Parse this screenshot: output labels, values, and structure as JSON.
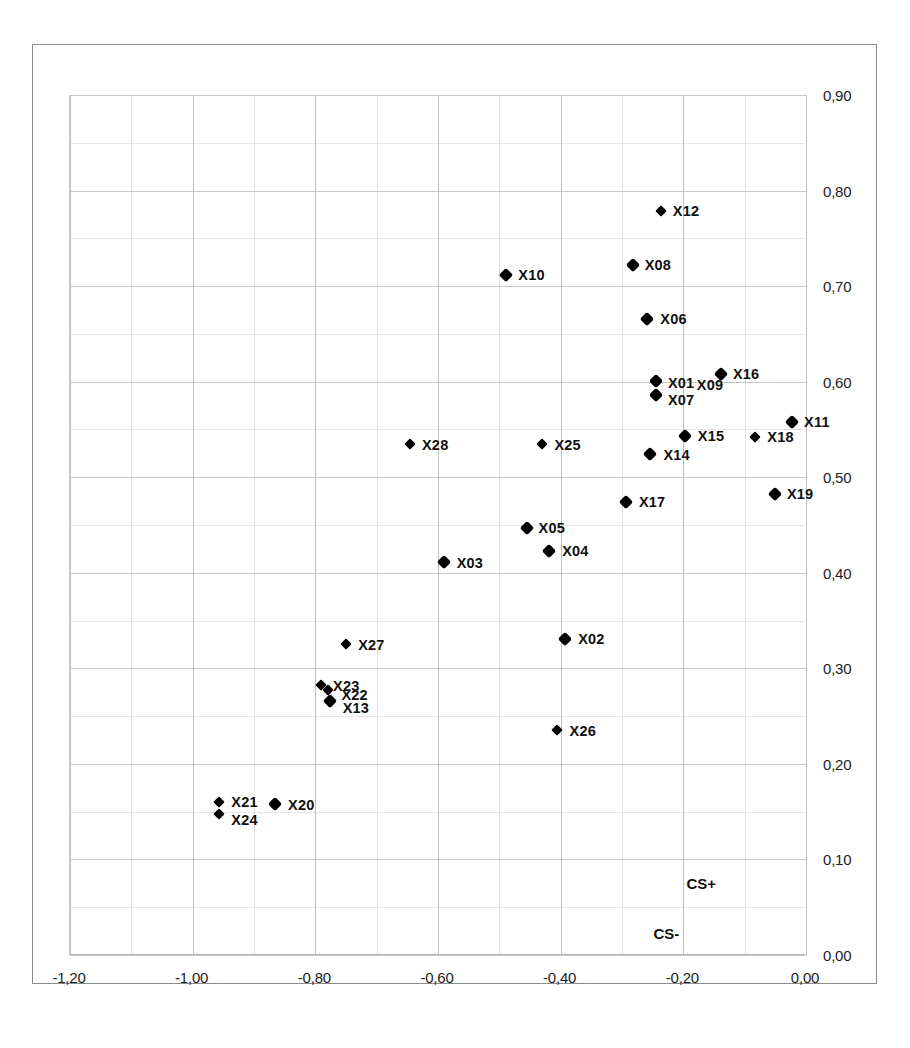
{
  "chart_data": {
    "type": "scatter",
    "title": "",
    "subtitle": "",
    "xlabel": "",
    "ylabel": "",
    "xlim": [
      -1.2,
      0.0
    ],
    "ylim": [
      0.0,
      0.9
    ],
    "grid": true,
    "legend": "none",
    "decimal_separator": ",",
    "xticks": [
      "-1,20",
      "-1,00",
      "-0,80",
      "-0,60",
      "-0,40",
      "-0,20",
      "0,00"
    ],
    "xtick_values": [
      -1.2,
      -1.0,
      -0.8,
      -0.6,
      -0.4,
      -0.2,
      0.0
    ],
    "yticks": [
      "0,00",
      "0,10",
      "0,20",
      "0,30",
      "0,40",
      "0,50",
      "0,60",
      "0,70",
      "0,80",
      "0,90"
    ],
    "ytick_values": [
      0.0,
      0.1,
      0.2,
      0.3,
      0.4,
      0.5,
      0.6,
      0.7,
      0.8,
      0.9
    ],
    "yaxis_position": "right",
    "marker_shape": "diamond",
    "marker_color": "#000000",
    "points": [
      {
        "label": "X12",
        "x": -0.235,
        "y": 0.779,
        "lx": 12,
        "ly": -8,
        "size": "small"
      },
      {
        "label": "X08",
        "x": -0.281,
        "y": 0.722,
        "lx": 12,
        "ly": -8,
        "size": "normal"
      },
      {
        "label": "X10",
        "x": -0.487,
        "y": 0.712,
        "lx": 12,
        "ly": -8,
        "size": "normal"
      },
      {
        "label": "X06",
        "x": -0.257,
        "y": 0.666,
        "lx": 13,
        "ly": -8,
        "size": "normal"
      },
      {
        "label": "X16",
        "x": -0.137,
        "y": 0.608,
        "lx": 12,
        "ly": -8,
        "size": "normal"
      },
      {
        "label": "X01",
        "x": -0.243,
        "y": 0.601,
        "lx": 12,
        "ly": -6,
        "size": "normal"
      },
      {
        "label": "X09",
        "x": -0.196,
        "y": 0.598,
        "lx": 12,
        "ly": -7,
        "size": "none"
      },
      {
        "label": "X07",
        "x": -0.243,
        "y": 0.586,
        "lx": 12,
        "ly": -3,
        "size": "normal"
      },
      {
        "label": "X11",
        "x": -0.021,
        "y": 0.558,
        "lx": 12,
        "ly": -8,
        "size": "normal"
      },
      {
        "label": "X18",
        "x": -0.081,
        "y": 0.542,
        "lx": 12,
        "ly": -8,
        "size": "small"
      },
      {
        "label": "X15",
        "x": -0.196,
        "y": 0.543,
        "lx": 13,
        "ly": -8,
        "size": "normal"
      },
      {
        "label": "X28",
        "x": -0.644,
        "y": 0.535,
        "lx": 12,
        "ly": -7,
        "size": "small"
      },
      {
        "label": "X25",
        "x": -0.428,
        "y": 0.535,
        "lx": 12,
        "ly": -7,
        "size": "small"
      },
      {
        "label": "X14",
        "x": -0.252,
        "y": 0.524,
        "lx": 13,
        "ly": -7,
        "size": "normal"
      },
      {
        "label": "X19",
        "x": -0.049,
        "y": 0.482,
        "lx": 12,
        "ly": -8,
        "size": "normal"
      },
      {
        "label": "X17",
        "x": -0.292,
        "y": 0.474,
        "lx": 13,
        "ly": -8,
        "size": "normal"
      },
      {
        "label": "X05",
        "x": -0.454,
        "y": 0.447,
        "lx": 12,
        "ly": -8,
        "size": "normal"
      },
      {
        "label": "X04",
        "x": -0.417,
        "y": 0.423,
        "lx": 13,
        "ly": -8,
        "size": "normal"
      },
      {
        "label": "X03",
        "x": -0.589,
        "y": 0.411,
        "lx": 13,
        "ly": -7,
        "size": "normal"
      },
      {
        "label": "X02",
        "x": -0.391,
        "y": 0.331,
        "lx": 13,
        "ly": -8,
        "size": "normal"
      },
      {
        "label": "X27",
        "x": -0.748,
        "y": 0.325,
        "lx": 12,
        "ly": -7,
        "size": "small"
      },
      {
        "label": "X23",
        "x": -0.789,
        "y": 0.283,
        "lx": 12,
        "ly": -7,
        "size": "small"
      },
      {
        "label": "X22",
        "x": -0.777,
        "y": 0.277,
        "lx": 13,
        "ly": -3,
        "size": "small"
      },
      {
        "label": "X13",
        "x": -0.775,
        "y": 0.266,
        "lx": 13,
        "ly": -1,
        "size": "normal"
      },
      {
        "label": "X26",
        "x": -0.405,
        "y": 0.235,
        "lx": 13,
        "ly": -7,
        "size": "small"
      },
      {
        "label": "X21",
        "x": -0.955,
        "y": 0.16,
        "lx": 12,
        "ly": -8,
        "size": "small"
      },
      {
        "label": "X20",
        "x": -0.864,
        "y": 0.158,
        "lx": 13,
        "ly": -7,
        "size": "normal"
      },
      {
        "label": "X24",
        "x": -0.955,
        "y": 0.148,
        "lx": 12,
        "ly": -2,
        "size": "small"
      }
    ],
    "annotations": [
      {
        "text": "CS+",
        "x": -0.145,
        "y": 0.075
      },
      {
        "text": "CS-",
        "x": -0.205,
        "y": 0.023
      }
    ]
  }
}
